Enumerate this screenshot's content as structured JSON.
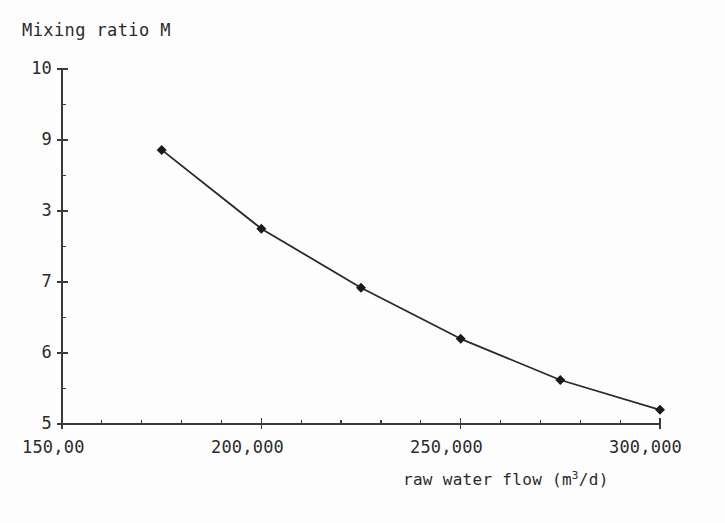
{
  "chart_data": {
    "type": "line",
    "title": "Mixing ratio M",
    "xlabel": "raw water flow (m3/d)",
    "xlabel_prefix": "raw water flow (m",
    "xlabel_sup": "3",
    "xlabel_suffix": "/d)",
    "ylabel": "Mixing ratio M",
    "x": [
      175000,
      200000,
      225000,
      250000,
      275000,
      300000
    ],
    "values": [
      8.86,
      7.75,
      6.92,
      6.2,
      5.62,
      5.2
    ],
    "series": [
      {
        "name": "Mixing ratio M",
        "values": [
          8.86,
          7.75,
          6.92,
          6.2,
          5.62,
          5.2
        ]
      }
    ],
    "xlim": [
      150000,
      300000
    ],
    "ylim": [
      5,
      10
    ],
    "grid": false,
    "legend": false,
    "marker": "diamond",
    "line_color": "#2a2a2a",
    "marker_color": "#1a1a1a",
    "axis_color": "#3a3a3a",
    "background": "#fdfdfd",
    "y_ticks": [
      {
        "value": 10,
        "label": "10"
      },
      {
        "value": 9,
        "label": "9"
      },
      {
        "value": 8,
        "label": "3"
      },
      {
        "value": 7,
        "label": "7"
      },
      {
        "value": 6,
        "label": "6"
      },
      {
        "value": 5,
        "label": "5"
      }
    ],
    "x_ticks": [
      {
        "value": 150000,
        "label": "150,00"
      },
      {
        "value": 200000,
        "label": "200,000"
      },
      {
        "value": 250000,
        "label": "250,000"
      },
      {
        "value": 300000,
        "label": "300,000"
      }
    ],
    "x_minor_step": 10000,
    "y_minor_step": 0.5
  }
}
